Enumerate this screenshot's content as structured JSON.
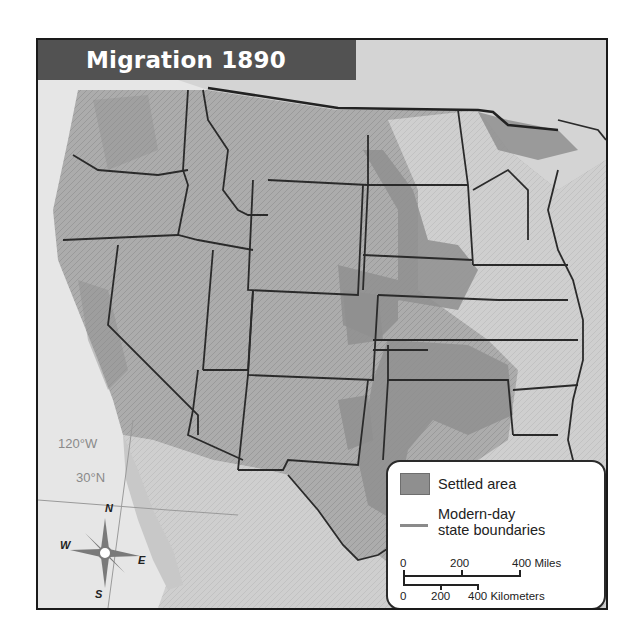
{
  "map": {
    "title": "Migration 1890",
    "colors": {
      "ocean": "#e6e6e6",
      "land": "#b3b3b3",
      "land_light": "#d2d2d2",
      "settled": "#8f8f8f",
      "title_bar": "#525252",
      "state_boundary": "#2a2a2a"
    },
    "legend": {
      "settled_label": "Settled area",
      "boundaries_label_line1": "Modern-day",
      "boundaries_label_line2": "state boundaries"
    },
    "scale": {
      "miles_ticks": [
        "0",
        "200",
        "400 Miles"
      ],
      "km_ticks": [
        "0",
        "200",
        "400 Kilometers"
      ]
    },
    "grid_labels": {
      "longitude": "120°W",
      "latitude": "30°N"
    },
    "compass": {
      "north": "N",
      "south": "S",
      "east": "E",
      "west": "W"
    }
  }
}
